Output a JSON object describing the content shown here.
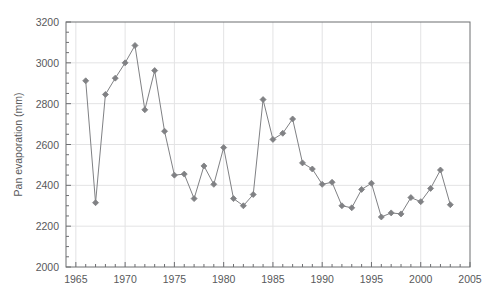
{
  "chart_data": {
    "type": "line",
    "title": "",
    "xlabel": "",
    "ylabel": "Pan evaporation (mm)",
    "xlim": [
      1964,
      2005
    ],
    "ylim": [
      2000,
      3200
    ],
    "ytick_step": 200,
    "ytick_minor_step": 50,
    "xtick_step": 5,
    "xtick_minor_step": 1,
    "grid": "major-gridlines both axes",
    "legend": "none",
    "marker": "diamond",
    "series_color": "#808184",
    "x": [
      1966,
      1967,
      1968,
      1969,
      1970,
      1971,
      1972,
      1973,
      1974,
      1975,
      1976,
      1977,
      1978,
      1979,
      1980,
      1981,
      1982,
      1983,
      1984,
      1985,
      1986,
      1987,
      1988,
      1989,
      1990,
      1991,
      1992,
      1993,
      1994,
      1995,
      1996,
      1997,
      1998,
      1999,
      2000,
      2001,
      2002,
      2003
    ],
    "values": [
      2912,
      2315,
      2845,
      2925,
      3000,
      3085,
      2770,
      2962,
      2665,
      2450,
      2455,
      2335,
      2495,
      2405,
      2585,
      2335,
      2300,
      2355,
      2820,
      2625,
      2655,
      2725,
      2510,
      2480,
      2405,
      2415,
      2300,
      2290,
      2380,
      2410,
      2245,
      2265,
      2260,
      2340,
      2320,
      2385,
      2475,
      2305
    ],
    "ytick_labels": [
      "2000",
      "2200",
      "2400",
      "2600",
      "2800",
      "3000",
      "3200"
    ],
    "ytick_values": [
      2000,
      2200,
      2400,
      2600,
      2800,
      3000,
      3200
    ],
    "xtick_labels": [
      "1965",
      "1970",
      "1975",
      "1980",
      "1985",
      "1990",
      "1995",
      "2000",
      "2005"
    ],
    "xtick_values": [
      1965,
      1970,
      1975,
      1980,
      1985,
      1990,
      1995,
      2000,
      2005
    ]
  },
  "figure": {
    "caption": "",
    "axis_color": "#6d6e71",
    "grid_color": "#e3e3e4",
    "background": "#ffffff"
  }
}
